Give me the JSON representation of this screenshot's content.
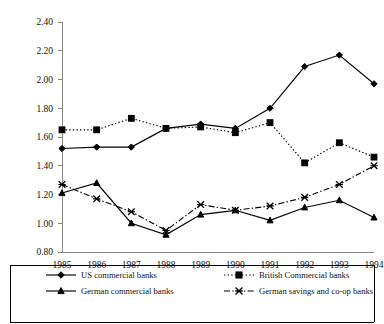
{
  "chart_data": {
    "type": "line",
    "title": "",
    "subtitle": "",
    "xlabel": "",
    "ylabel": "",
    "categories": [
      "1985",
      "1986",
      "1987",
      "1988",
      "1989",
      "1990",
      "1991",
      "1992",
      "1993",
      "1994"
    ],
    "x": [
      1985,
      1986,
      1987,
      1988,
      1989,
      1990,
      1991,
      1992,
      1993,
      1994
    ],
    "ylim": [
      0.8,
      2.4
    ],
    "ytick_labels": [
      "0.80",
      "1.00",
      "1.20",
      "1.40",
      "1.60",
      "1.80",
      "2.00",
      "2.20",
      "2.40"
    ],
    "ytick_values": [
      0.8,
      1.0,
      1.2,
      1.4,
      1.6,
      1.8,
      2.0,
      2.2,
      2.4
    ],
    "grid": false,
    "legend_position": "bottom",
    "series": [
      {
        "name": "US commercial banks",
        "marker": "diamond",
        "line_style": "solid",
        "color": "#000000",
        "values": [
          1.52,
          1.53,
          1.53,
          1.66,
          1.69,
          1.66,
          1.8,
          2.09,
          2.17,
          1.97
        ]
      },
      {
        "name": "British Commercial banks",
        "marker": "square",
        "line_style": "dotted",
        "color": "#000000",
        "values": [
          1.65,
          1.65,
          1.73,
          1.66,
          1.67,
          1.63,
          1.7,
          1.42,
          1.56,
          1.46
        ]
      },
      {
        "name": "German commercial banks",
        "marker": "triangle",
        "line_style": "solid",
        "color": "#000000",
        "values": [
          1.21,
          1.28,
          1.0,
          0.92,
          1.06,
          1.09,
          1.02,
          1.11,
          1.16,
          1.04
        ]
      },
      {
        "name": "German savings and co-op banks",
        "marker": "cross",
        "line_style": "dashdot",
        "color": "#000000",
        "values": [
          1.27,
          1.17,
          1.08,
          0.95,
          1.13,
          1.09,
          1.12,
          1.18,
          1.27,
          1.4
        ]
      }
    ]
  },
  "legend": {
    "entries": [
      {
        "label": "US commercial banks"
      },
      {
        "label": "British Commercial banks"
      },
      {
        "label": "German commercial banks"
      },
      {
        "label": "German savings and co-op banks"
      }
    ]
  }
}
